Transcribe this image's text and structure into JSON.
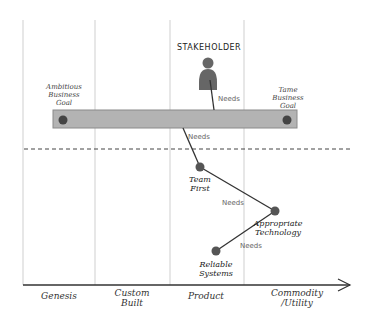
{
  "diagram": {
    "stakeholder": {
      "label": "STAKEHOLDER",
      "icon": "person-icon"
    },
    "goals": {
      "left": {
        "line1": "Ambitious",
        "line2": "Business",
        "line3": "Goal"
      },
      "right": {
        "line1": "Tame",
        "line2": "Business",
        "line3": "Goal"
      }
    },
    "nodes": [
      {
        "id": "team-first",
        "line1": "Team",
        "line2": "First"
      },
      {
        "id": "appropriate-technology",
        "line1": "Appropriate",
        "line2": "Technology"
      },
      {
        "id": "reliable-systems",
        "line1": "Reliable",
        "line2": "Systems"
      }
    ],
    "edge_labels": {
      "stakeholder_to_bar": "Needs",
      "bar_to_team": "Needs",
      "team_to_tech": "Needs",
      "tech_to_reliable": "Needs"
    },
    "axis": {
      "stages": [
        {
          "line1": "Genesis",
          "line2": ""
        },
        {
          "line1": "Custom",
          "line2": "Built"
        },
        {
          "line1": "Product",
          "line2": ""
        },
        {
          "line1": "Commodity",
          "line2": "/Utility"
        }
      ]
    },
    "colors": {
      "bar_fill": "#b3b3b3",
      "bar_stroke": "#888888",
      "node_fill": "#555555",
      "line": "#333333",
      "grid": "#d0d0d0"
    }
  }
}
